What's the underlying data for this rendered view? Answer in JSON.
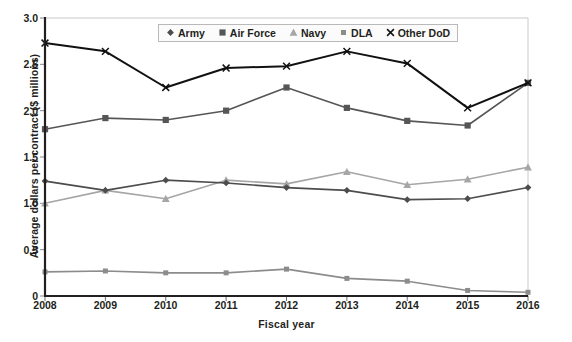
{
  "chart_data": {
    "type": "line",
    "title": "",
    "xlabel": "Fiscal year",
    "ylabel": "Average dollars per contract ($ millions)",
    "x": [
      2008,
      2009,
      2010,
      2011,
      2012,
      2013,
      2014,
      2015,
      2016
    ],
    "categories": [
      "2008",
      "2009",
      "2010",
      "2011",
      "2012",
      "2013",
      "2014",
      "2015",
      "2016"
    ],
    "xlim": [
      2008,
      2016
    ],
    "ylim": [
      0,
      3.0
    ],
    "y_ticks": [
      "0",
      "0.5",
      "1.0",
      "1.5",
      "2.0",
      "2.5",
      "3.0"
    ],
    "y_tick_values": [
      0,
      0.5,
      1.0,
      1.5,
      2.0,
      2.5,
      3.0
    ],
    "grid": false,
    "legend_position": "top-center",
    "series": [
      {
        "name": "Army",
        "marker": "diamond",
        "color": "#4d4d4d",
        "values": [
          1.24,
          1.14,
          1.25,
          1.22,
          1.17,
          1.14,
          1.04,
          1.05,
          1.17
        ]
      },
      {
        "name": "Air Force",
        "marker": "square",
        "color": "#565656",
        "values": [
          1.8,
          1.92,
          1.9,
          2.0,
          2.25,
          2.03,
          1.89,
          1.84,
          2.3
        ]
      },
      {
        "name": "Navy",
        "marker": "triangle",
        "color": "#a6a6a6",
        "values": [
          1.0,
          1.14,
          1.05,
          1.25,
          1.21,
          1.34,
          1.2,
          1.26,
          1.39
        ]
      },
      {
        "name": "DLA",
        "marker": "small-square",
        "color": "#8c8c8c",
        "values": [
          0.26,
          0.27,
          0.25,
          0.25,
          0.29,
          0.19,
          0.16,
          0.06,
          0.04
        ]
      },
      {
        "name": "Other DoD",
        "marker": "x",
        "color": "#111111",
        "values": [
          2.73,
          2.64,
          2.25,
          2.46,
          2.48,
          2.64,
          2.51,
          2.03,
          2.3
        ]
      }
    ]
  },
  "colors": {
    "axis": "#231f20",
    "plot_border": "#c9c9c9",
    "background": "#ffffff",
    "legend_background": "#fbfbfb",
    "legend_border": "#b9b9b9"
  }
}
